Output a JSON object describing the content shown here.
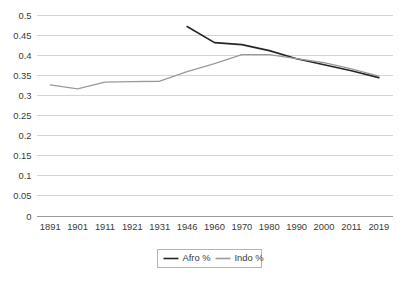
{
  "chart_data": {
    "type": "line",
    "title": "",
    "xlabel": "",
    "ylabel": "",
    "categories": [
      "1891",
      "1901",
      "1911",
      "1921",
      "1931",
      "1946",
      "1960",
      "1970",
      "1980",
      "1990",
      "2000",
      "2011",
      "2019"
    ],
    "ylim": [
      0,
      0.5
    ],
    "yticks": [
      "0",
      "0.05",
      "0.1",
      "0.15",
      "0.2",
      "0.25",
      "0.3",
      "0.35",
      "0.4",
      "0.45",
      "0.5"
    ],
    "ytick_values": [
      0,
      0.05,
      0.1,
      0.15,
      0.2,
      0.25,
      0.3,
      0.35,
      0.4,
      0.45,
      0.5
    ],
    "grid": true,
    "legend_position": "bottom",
    "series": [
      {
        "name": "Afro %",
        "color": "#262626",
        "values": [
          null,
          null,
          null,
          null,
          null,
          0.47,
          0.43,
          0.425,
          0.41,
          0.39,
          0.375,
          0.36,
          0.343
        ]
      },
      {
        "name": "Indo %",
        "color": "#9a9a9a",
        "values": [
          0.325,
          0.315,
          0.332,
          0.333,
          0.334,
          0.358,
          0.378,
          0.4,
          0.4,
          0.39,
          0.38,
          0.365,
          0.347
        ]
      }
    ]
  },
  "legend": {
    "entries": [
      {
        "label": "Afro %"
      },
      {
        "label": "Indo %"
      }
    ]
  },
  "colors": {
    "grid": "#d4d4d4",
    "axis": "#9a9a9a",
    "text": "#3a3a3a",
    "background": "#ffffff"
  }
}
